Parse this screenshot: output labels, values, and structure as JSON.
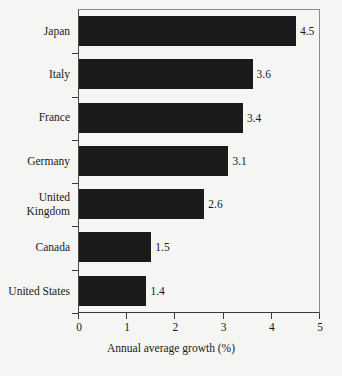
{
  "chart_data": {
    "type": "bar",
    "orientation": "horizontal",
    "title": "",
    "xlabel": "Annual average growth (%)",
    "ylabel": "",
    "categories": [
      "Japan",
      "Italy",
      "France",
      "Germany",
      "United Kingdom",
      "Canada",
      "United States"
    ],
    "values": [
      4.5,
      3.6,
      3.4,
      3.1,
      2.6,
      1.5,
      1.4
    ],
    "value_labels": [
      "4.5",
      "3.6",
      "3.4",
      "3.1",
      "2.6",
      "1.5",
      "1.4"
    ],
    "xlim": [
      0,
      5
    ],
    "xticks": [
      0,
      1,
      2,
      3,
      4,
      5
    ],
    "xtick_labels": [
      "0",
      "1",
      "2",
      "3",
      "4",
      "5"
    ],
    "grid": false,
    "legend": null,
    "bar_color": "#1a1a1a",
    "background_color": "#f5f5f3",
    "text_color": "#1a1a1a",
    "axis_color": "#3a3a3a"
  },
  "category_label_lines": [
    [
      "Japan"
    ],
    [
      "Italy"
    ],
    [
      "France"
    ],
    [
      "Germany"
    ],
    [
      "United",
      "Kingdom"
    ],
    [
      "Canada"
    ],
    [
      "United States"
    ]
  ]
}
